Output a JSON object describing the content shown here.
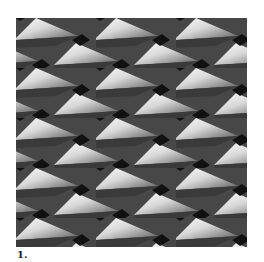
{
  "figure": {
    "colors": {
      "dark": "#4a4a4a",
      "band": "#3c3c3c",
      "gap": "#111111",
      "light": "#f4f4f4",
      "mid": "#8a8a8a"
    }
  },
  "caption": {
    "label": "1."
  }
}
